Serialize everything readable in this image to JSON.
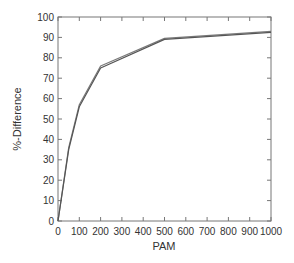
{
  "chart_data": {
    "type": "line",
    "title": "",
    "xlabel": "PAM",
    "ylabel": "%-Difference",
    "xlim": [
      0,
      1000
    ],
    "ylim": [
      0,
      100
    ],
    "x_ticks": [
      0,
      100,
      200,
      300,
      400,
      500,
      600,
      700,
      800,
      900,
      1000
    ],
    "y_ticks": [
      0,
      10,
      20,
      30,
      40,
      50,
      60,
      70,
      80,
      90,
      100
    ],
    "grid": false,
    "legend": null,
    "series": [
      {
        "name": "series-1",
        "x": [
          0,
          50,
          100,
          200,
          500,
          1000
        ],
        "values": [
          0,
          36,
          57,
          76,
          89.5,
          93
        ]
      },
      {
        "name": "series-2",
        "x": [
          0,
          50,
          100,
          200,
          500,
          1000
        ],
        "values": [
          0,
          35,
          56,
          75,
          89,
          92.5
        ]
      }
    ],
    "colors": {
      "series-1": "#7a7a7a",
      "series-2": "#555555",
      "axis": "#777777"
    }
  }
}
